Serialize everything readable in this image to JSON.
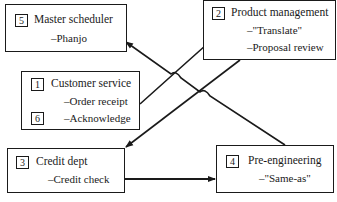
{
  "diagram": {
    "nodes": [
      {
        "id": "5",
        "number": "5",
        "title": "Master scheduler",
        "items": [
          "–Phanjo"
        ]
      },
      {
        "id": "2",
        "number": "2",
        "title": "Product management",
        "items": [
          "–\"Translate\"",
          "–Proposal review"
        ]
      },
      {
        "id": "1",
        "number": "1",
        "number2": "6",
        "title": "Customer service",
        "items": [
          "–Order receipt",
          "–Acknowledge"
        ]
      },
      {
        "id": "3",
        "number": "3",
        "title": "Credit dept",
        "items": [
          "–Credit check"
        ]
      },
      {
        "id": "4",
        "number": "4",
        "title": "Pre-engineering",
        "items": [
          "–\"Same-as\""
        ]
      }
    ],
    "edges": [
      {
        "from": "1",
        "to": "2",
        "label": ""
      },
      {
        "from": "2",
        "to": "3",
        "label": ""
      },
      {
        "from": "3",
        "to": "4",
        "label": ""
      },
      {
        "from": "4",
        "to": "5",
        "label": ""
      }
    ]
  }
}
